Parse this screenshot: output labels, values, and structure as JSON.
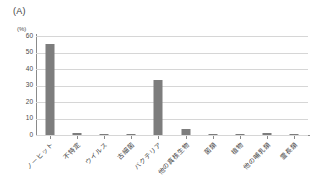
{
  "figure": {
    "panel_label": "(A)",
    "unit_label": "(%)"
  },
  "chart_data": {
    "type": "bar",
    "title": "(A)",
    "xlabel": "",
    "ylabel": "(%)",
    "ylim": [
      0,
      60
    ],
    "yticks": [
      0,
      10,
      20,
      30,
      40,
      50,
      60
    ],
    "grid": true,
    "legend": false,
    "bar_color": "#7d7d7d",
    "categories": [
      "ノーヒット",
      "不特定",
      "ウイルス",
      "古細菌",
      "バクテリア",
      "他の真核生物",
      "菌類",
      "植物",
      "他の哺乳類",
      "霊長類"
    ],
    "values": [
      55.2,
      1.5,
      0.5,
      0.6,
      33.4,
      3.4,
      0.7,
      0.9,
      1.0,
      0.8
    ]
  }
}
